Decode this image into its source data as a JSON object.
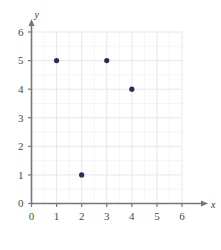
{
  "chart_data": {
    "type": "scatter",
    "title": "",
    "subtitle": "",
    "xlabel": "x",
    "ylabel": "y",
    "xlim": [
      0,
      6
    ],
    "ylim": [
      0,
      6
    ],
    "xticks": [
      0,
      1,
      2,
      3,
      4,
      5,
      6
    ],
    "yticks": [
      0,
      1,
      2,
      3,
      4,
      5,
      6
    ],
    "xtick_labels": [
      "0",
      "1",
      "2",
      "3",
      "4",
      "5",
      "6"
    ],
    "ytick_labels": [
      "0",
      "1",
      "2",
      "3",
      "4",
      "5",
      "6"
    ],
    "grid": true,
    "grid_major_step": 1,
    "grid_minor_step": 0.5,
    "legend": null,
    "series": [
      {
        "name": "points",
        "marker": "circle",
        "color": "#2b2b55",
        "points": [
          {
            "x": 1,
            "y": 5
          },
          {
            "x": 2,
            "y": 1
          },
          {
            "x": 3,
            "y": 5
          },
          {
            "x": 4,
            "y": 4
          }
        ]
      }
    ],
    "annotations": []
  },
  "axes": {
    "x_axis_label": "x",
    "y_axis_label": "y",
    "x_arrow": true,
    "y_arrow": true,
    "axis_color": "#777777",
    "grid_major_color": "#e6e6ef",
    "grid_minor_color": "#f2f2f8",
    "marker_color": "#2b2b55",
    "tick_text_color": "#4a4a4a"
  }
}
